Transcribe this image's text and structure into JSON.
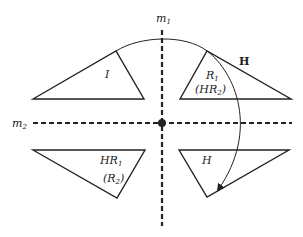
{
  "diagram": {
    "axes": {
      "m1": {
        "label": "m",
        "subscript": "1"
      },
      "m2": {
        "label": "m",
        "subscript": "2"
      }
    },
    "arc_label": "H",
    "regions": {
      "top_left": {
        "line1": "I",
        "line1_sub": ""
      },
      "top_right": {
        "line1": "R",
        "line1_sub": "1",
        "line2": "(HR",
        "line2_sub": "2",
        "line2_end": ")"
      },
      "bottom_left": {
        "line1": "HR",
        "line1_sub": "1",
        "line2": "(R",
        "line2_sub": "2",
        "line2_end": ")"
      },
      "bottom_right": {
        "line1": "H",
        "line1_sub": ""
      }
    },
    "colors": {
      "stroke": "#222222",
      "background": "#ffffff"
    }
  }
}
